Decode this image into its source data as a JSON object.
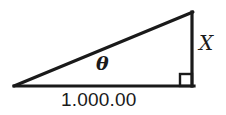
{
  "figure": {
    "kind": "right-triangle-diagram",
    "background_color": "#ffffff",
    "stroke_color": "#1a1a1a",
    "labels": {
      "angle": "θ",
      "opposite_side": "X",
      "base": "1.000.00"
    },
    "geometry": {
      "left_vertex": [
        14,
        86
      ],
      "right_vertex": [
        193,
        86
      ],
      "apex": [
        193,
        12
      ],
      "right_angle_marker": {
        "x": 180,
        "y": 73,
        "size": 13
      },
      "base_line_width": 3,
      "hypotenuse_line_width": 3,
      "vertical_line_width": 3
    }
  }
}
